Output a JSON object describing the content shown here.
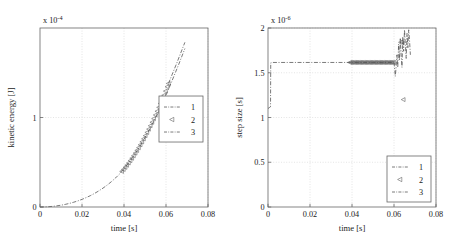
{
  "figure": {
    "panels": [
      "left",
      "right"
    ],
    "background": "#ffffff",
    "line_color": "#4d4d4d",
    "frame_color": "#666666",
    "grid_color": "#c8c8c8"
  },
  "chart_data": [
    {
      "type": "line",
      "panel": "left",
      "title": "",
      "xlabel": "time [s]",
      "ylabel": "kinetic energy [J]",
      "y_exponent_label": "x 10",
      "y_exponent_value": "-4",
      "y_scale": 0.0001,
      "xlim": [
        0,
        0.08
      ],
      "ylim": [
        0,
        0.0002
      ],
      "xticks": [
        0,
        0.02,
        0.04,
        0.06,
        0.08
      ],
      "xticklabels": [
        "0",
        "0.02",
        "0.04",
        "0.06",
        "0.08"
      ],
      "yticks": [
        0,
        0.0001
      ],
      "yticklabels": [
        "0",
        "1"
      ],
      "grid": true,
      "legend_position": "center-right",
      "legend": [
        {
          "label": "1",
          "style": "dash-dot"
        },
        {
          "label": "2",
          "style": "triangle-left-marker"
        },
        {
          "label": "3",
          "style": "dash-dot"
        }
      ],
      "series": [
        {
          "name": "1",
          "style": "dash-dot",
          "x": [
            0,
            0.002,
            0.004,
            0.006,
            0.008,
            0.01,
            0.012,
            0.014,
            0.016,
            0.018,
            0.02,
            0.022,
            0.024,
            0.026,
            0.028,
            0.03,
            0.032,
            0.034,
            0.036,
            0.038,
            0.04,
            0.042,
            0.044,
            0.046,
            0.048,
            0.05,
            0.052,
            0.054,
            0.056,
            0.058,
            0.06,
            0.062,
            0.064,
            0.066,
            0.068,
            0.069
          ],
          "y": [
            0.0,
            0.0008,
            0.0032,
            0.0072,
            0.0128,
            0.02,
            0.029,
            0.04,
            0.053,
            0.068,
            0.0855,
            0.105,
            0.127,
            0.152,
            0.18,
            0.211,
            0.245,
            0.283,
            0.325,
            0.372,
            0.425,
            0.485,
            0.55,
            0.62,
            0.695,
            0.775,
            0.86,
            0.95,
            1.045,
            1.145,
            1.25,
            1.36,
            1.475,
            1.59,
            1.71,
            1.77
          ]
        },
        {
          "name": "2",
          "style": "triangle-left-marker",
          "x": [
            0.039,
            0.0398,
            0.0406,
            0.0414,
            0.0422,
            0.043,
            0.0438,
            0.0446,
            0.0454,
            0.0462,
            0.047,
            0.0478,
            0.0486,
            0.0494,
            0.0502,
            0.051,
            0.0518,
            0.0526,
            0.0534,
            0.0542,
            0.055,
            0.0558,
            0.0566,
            0.0574,
            0.0582,
            0.059,
            0.0598,
            0.0606,
            0.0612
          ],
          "y": [
            0.398,
            0.42,
            0.443,
            0.467,
            0.492,
            0.518,
            0.545,
            0.573,
            0.602,
            0.632,
            0.663,
            0.695,
            0.728,
            0.762,
            0.797,
            0.833,
            0.87,
            0.908,
            0.947,
            0.987,
            1.028,
            1.07,
            1.113,
            1.157,
            1.202,
            1.248,
            1.295,
            1.343,
            1.38
          ]
        },
        {
          "name": "3",
          "style": "dash-dot",
          "x": [
            0.0612,
            0.063,
            0.065,
            0.067,
            0.069
          ],
          "y": [
            1.38,
            1.485,
            1.6,
            1.72,
            1.84
          ]
        }
      ]
    },
    {
      "type": "line",
      "panel": "right",
      "title": "",
      "xlabel": "time [s]",
      "ylabel": "step size [s]",
      "y_exponent_label": "x 10",
      "y_exponent_value": "-6",
      "y_scale": 1e-06,
      "xlim": [
        0,
        0.08
      ],
      "ylim": [
        0,
        2e-06
      ],
      "xticks": [
        0,
        0.02,
        0.04,
        0.06,
        0.08
      ],
      "xticklabels": [
        "0",
        "0.02",
        "0.04",
        "0.06",
        "0.08"
      ],
      "yticks": [
        0,
        5e-07,
        1e-06,
        1.5e-06,
        2e-06
      ],
      "yticklabels": [
        "0",
        "0.5",
        "1",
        "1.5",
        "2"
      ],
      "grid": true,
      "legend_position": "bottom-right",
      "legend": [
        {
          "label": "1",
          "style": "dash-dot"
        },
        {
          "label": "2",
          "style": "triangle-left-marker"
        },
        {
          "label": "3",
          "style": "dash-dot"
        }
      ],
      "series": [
        {
          "name": "1",
          "style": "dash-dot",
          "x": [
            0.0,
            0.0006,
            0.0012,
            0.0013,
            0.002,
            0.01,
            0.02,
            0.03,
            0.039,
            0.05,
            0.059,
            0.06
          ],
          "y": [
            1.1,
            1.11,
            1.12,
            1.61,
            1.615,
            1.615,
            1.615,
            1.615,
            1.615,
            1.615,
            1.615,
            1.615
          ]
        },
        {
          "name": "2",
          "style": "triangle-left-marker",
          "x": [
            0.039,
            0.0396,
            0.0402,
            0.0408,
            0.0414,
            0.042,
            0.0426,
            0.0432,
            0.0438,
            0.0444,
            0.045,
            0.0456,
            0.0462,
            0.0468,
            0.0474,
            0.048,
            0.0486,
            0.0492,
            0.0498,
            0.0504,
            0.051,
            0.0516,
            0.0522,
            0.0528,
            0.0534,
            0.054,
            0.0546,
            0.0552,
            0.0558,
            0.0564,
            0.057,
            0.0576,
            0.0582,
            0.0588,
            0.0594,
            0.06,
            0.0632,
            0.0638,
            0.0645
          ],
          "y": [
            1.615,
            1.615,
            1.615,
            1.615,
            1.615,
            1.615,
            1.615,
            1.615,
            1.615,
            1.615,
            1.615,
            1.615,
            1.615,
            1.615,
            1.615,
            1.615,
            1.615,
            1.615,
            1.615,
            1.615,
            1.615,
            1.615,
            1.615,
            1.615,
            1.615,
            1.615,
            1.615,
            1.615,
            1.615,
            1.615,
            1.615,
            1.615,
            1.615,
            1.615,
            1.615,
            1.615,
            1.84,
            1.845,
            1.2
          ]
        },
        {
          "name": "3",
          "style": "dash-dot-erratic",
          "x": [
            0.06,
            0.0604,
            0.0606,
            0.061,
            0.0614,
            0.0618,
            0.0622,
            0.0626,
            0.063,
            0.0634,
            0.0638,
            0.0642,
            0.0646,
            0.065,
            0.0654,
            0.0658,
            0.0662,
            0.0666,
            0.067,
            0.0674,
            0.0678
          ],
          "y": [
            1.615,
            1.52,
            1.46,
            1.56,
            1.7,
            1.56,
            1.82,
            1.64,
            1.88,
            1.7,
            1.56,
            1.9,
            1.74,
            1.98,
            1.82,
            1.66,
            1.94,
            1.78,
            1.98,
            1.86,
            1.7
          ]
        }
      ]
    }
  ]
}
